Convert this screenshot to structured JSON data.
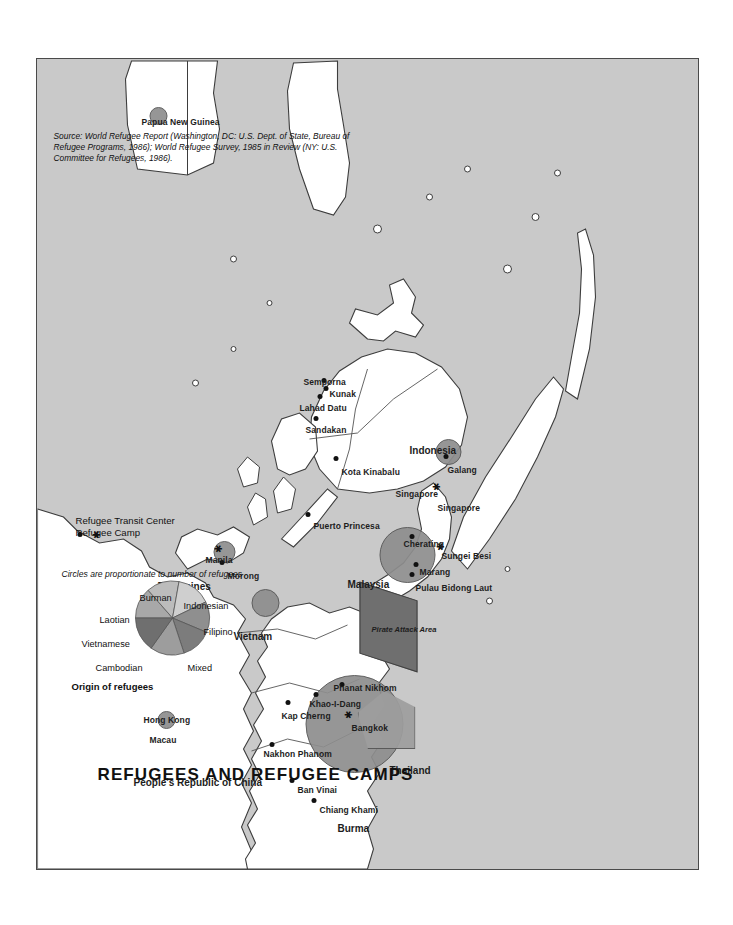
{
  "map": {
    "title": "REFUGEES AND REFUGEE CAMPS",
    "source": "Source: World Refugee Report (Washington, DC: U.S. Dept. of State, Bureau of Refugee Programs, 1986); World Refugee Survey, 1985 in Review (NY: U.S. Committee for Refugees, 1986).",
    "background_color": "#c9c9c9",
    "land_color": "#ffffff",
    "bubble_color": "#8e8e8e"
  },
  "legend": {
    "origin_heading": "Origin of refugees",
    "scale_note": "Circles are proportionate to number of refugees",
    "wedges": [
      {
        "label": "Cambodian",
        "share": 14,
        "color": "#a8a8a8"
      },
      {
        "label": "Vietnamese",
        "share": 14,
        "color": "#bcbcbc"
      },
      {
        "label": "Laotian",
        "share": 14,
        "color": "#cfcfcf"
      },
      {
        "label": "Burman",
        "share": 14,
        "color": "#8f8f8f"
      },
      {
        "label": "Indonesian",
        "share": 14,
        "color": "#7c7c7c"
      },
      {
        "label": "Filipino",
        "share": 14,
        "color": "#9d9d9d"
      },
      {
        "label": "Mixed",
        "share": 16,
        "color": "#6f6f6f"
      }
    ],
    "symbols": [
      {
        "glyph": "dot",
        "label": "Refugee Camp"
      },
      {
        "glyph": "star",
        "label": "Refugee Transit Center"
      }
    ]
  },
  "countries": [
    {
      "name": "People's Republic of China"
    },
    {
      "name": "Macau"
    },
    {
      "name": "Hong Kong"
    },
    {
      "name": "Burma"
    },
    {
      "name": "Thailand"
    },
    {
      "name": "Vietnam"
    },
    {
      "name": "Philippines"
    },
    {
      "name": "Malaysia"
    },
    {
      "name": "Singapore"
    },
    {
      "name": "Indonesia"
    },
    {
      "name": "Papua New Guinea"
    }
  ],
  "camps": [
    {
      "name": "Chiang Khami",
      "type": "camp"
    },
    {
      "name": "Ban Vinai",
      "type": "camp"
    },
    {
      "name": "Nakhon Phanom",
      "type": "camp"
    },
    {
      "name": "Kap Cherng",
      "type": "camp"
    },
    {
      "name": "Khao-I-Dang",
      "type": "camp"
    },
    {
      "name": "Phanat Nikhom",
      "type": "camp"
    },
    {
      "name": "Bangkok",
      "type": "transit"
    },
    {
      "name": "Pulau Bidong Laut",
      "type": "camp"
    },
    {
      "name": "Marang",
      "type": "camp"
    },
    {
      "name": "Cherating",
      "type": "camp"
    },
    {
      "name": "Sungei Besi",
      "type": "transit"
    },
    {
      "name": "Singapore",
      "type": "transit"
    },
    {
      "name": "Galang",
      "type": "camp"
    },
    {
      "name": "Kota Kinabalu",
      "type": "camp"
    },
    {
      "name": "Sandakan",
      "type": "camp"
    },
    {
      "name": "Lahad Datu",
      "type": "camp"
    },
    {
      "name": "Kunak",
      "type": "camp"
    },
    {
      "name": "Semporna",
      "type": "camp"
    },
    {
      "name": "Puerto Princesa",
      "type": "camp"
    },
    {
      "name": "Morong",
      "type": "camp"
    },
    {
      "name": "Manila",
      "type": "transit"
    }
  ],
  "annotations": [
    {
      "label": "Pirate Attack Area"
    }
  ]
}
